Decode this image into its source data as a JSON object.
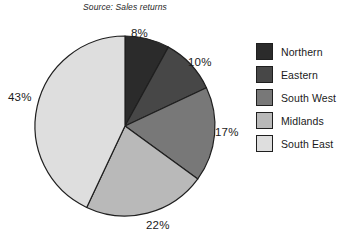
{
  "source_note": "Source: Sales returns",
  "chart_data": {
    "type": "pie",
    "title": "",
    "subtitle": "Source: Sales returns",
    "categories": [
      "Northern",
      "Eastern",
      "South West",
      "Midlands",
      "South East"
    ],
    "values": [
      8,
      10,
      17,
      22,
      43
    ],
    "value_labels": [
      "8%",
      "10%",
      "17%",
      "22%",
      "43%"
    ],
    "unit": "%",
    "start_angle_deg": 0,
    "direction": "clockwise",
    "legend_position": "right",
    "grid": false,
    "colors": [
      "#2b2b2b",
      "#474747",
      "#787878",
      "#b9b9b9",
      "#dedede"
    ],
    "slice_outline_color": "#1f1f1f",
    "slices": [
      {
        "label": "Northern",
        "value": 8,
        "value_label": "8%",
        "color": "#2b2b2b"
      },
      {
        "label": "Eastern",
        "value": 10,
        "value_label": "10%",
        "color": "#474747"
      },
      {
        "label": "South West",
        "value": 17,
        "value_label": "17%",
        "color": "#787878"
      },
      {
        "label": "Midlands",
        "value": 22,
        "value_label": "22%",
        "color": "#b9b9b9"
      },
      {
        "label": "South East",
        "value": 43,
        "value_label": "43%",
        "color": "#dedede"
      }
    ]
  },
  "legend": {
    "items": [
      {
        "label": "Northern",
        "color": "#2b2b2b"
      },
      {
        "label": "Eastern",
        "color": "#474747"
      },
      {
        "label": "South West",
        "color": "#787878"
      },
      {
        "label": "Midlands",
        "color": "#b9b9b9"
      },
      {
        "label": "South East",
        "color": "#dedede"
      }
    ]
  }
}
